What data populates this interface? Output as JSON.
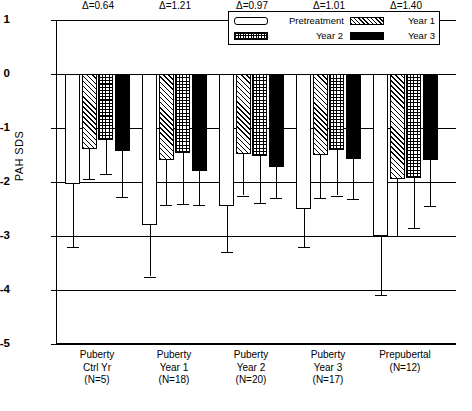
{
  "chart_data": {
    "type": "bar",
    "title": "",
    "xlabel": "",
    "ylabel": "PAH SDS",
    "ylim": [
      -5,
      1
    ],
    "yticks": [
      1,
      0,
      -1,
      -2,
      -3,
      -4,
      -5
    ],
    "ytick_labels": [
      "1",
      "0",
      "-1",
      "-2",
      "-3",
      "-4",
      "-5"
    ],
    "grid": true,
    "legend_position": "top-right",
    "categories": [
      "Puberty Ctrl Yr (N=5)",
      "Puberty Year 1 (N=18)",
      "Puberty Year 2 (N=20)",
      "Puberty Year 3 (N=17)",
      "Prepubertal (N=12)"
    ],
    "series": [
      {
        "name": "Pretreatment",
        "values": [
          -2.03,
          -2.8,
          -2.45,
          -2.5,
          -3.0
        ],
        "err_low": [
          -3.2,
          -3.75,
          -3.3,
          -3.2,
          -4.1
        ]
      },
      {
        "name": "Year 1",
        "values": [
          -1.39,
          -1.59,
          -1.48,
          -1.5,
          -1.95
        ],
        "err_low": [
          -1.95,
          -2.42,
          -2.25,
          -2.3,
          -3.0
        ]
      },
      {
        "name": "Year 2",
        "values": [
          -1.22,
          -1.47,
          -1.52,
          -1.4,
          -1.92
        ],
        "err_low": [
          -1.85,
          -2.4,
          -2.38,
          -2.25,
          -2.85
        ]
      },
      {
        "name": "Year 3",
        "values": [
          -1.43,
          -1.8,
          -1.72,
          -1.58,
          -1.6
        ],
        "err_low": [
          -2.28,
          -2.42,
          -2.3,
          -2.32,
          -2.45
        ]
      }
    ],
    "annotations": [
      {
        "text": "Δ=0.64",
        "group": 0
      },
      {
        "text": "Δ=1.21",
        "group": 1
      },
      {
        "text": "Δ=0.97",
        "group": 2
      },
      {
        "text": "Δ=1.01",
        "group": 3
      },
      {
        "text": "Δ=1.40",
        "group": 4
      }
    ]
  },
  "axis": {
    "y_title": "PAH SDS",
    "y_tick_labels": [
      "1",
      "0",
      "-1",
      "-2",
      "-3",
      "-4",
      "-5"
    ]
  },
  "legend": {
    "entries": [
      {
        "label": "Pretreatment",
        "swatch": "swatch-white-icon",
        "pattern": "pre"
      },
      {
        "label": "Year 1",
        "swatch": "swatch-diagonal-icon",
        "pattern": "y1"
      },
      {
        "label": "Year 2",
        "swatch": "swatch-checkerboard-icon",
        "pattern": "y2"
      },
      {
        "label": "Year 3",
        "swatch": "swatch-solid-black-icon",
        "pattern": "y3"
      }
    ]
  },
  "x_labels": [
    {
      "line1": "Puberty",
      "line2": "Ctrl Yr",
      "line3": "(N=5)"
    },
    {
      "line1": "Puberty",
      "line2": "Year 1",
      "line3": "(N=18)"
    },
    {
      "line1": "Puberty",
      "line2": "Year 2",
      "line3": "(N=20)"
    },
    {
      "line1": "Puberty",
      "line2": "Year 3",
      "line3": "(N=17)"
    },
    {
      "line1": "Prepubertal",
      "line2": "(N=12)",
      "line3": ""
    }
  ],
  "colors": {
    "ink": "#000000",
    "paper": "#ffffff"
  }
}
